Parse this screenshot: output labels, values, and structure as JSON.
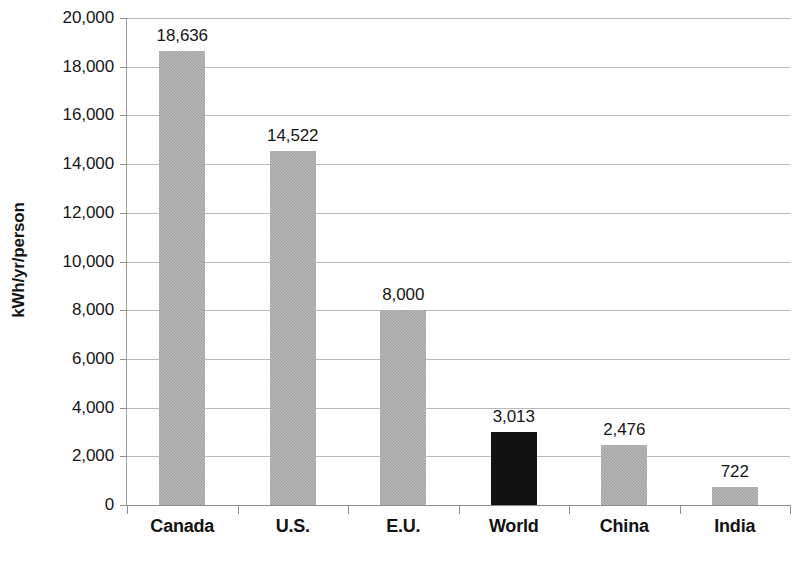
{
  "chart_data": {
    "type": "bar",
    "title": "",
    "xlabel": "",
    "ylabel": "kWh/yr/person",
    "categories": [
      "Canada",
      "U.S.",
      "E.U.",
      "World",
      "China",
      "India"
    ],
    "values": [
      18636,
      14522,
      8000,
      3013,
      2476,
      722
    ],
    "value_labels": [
      "18,636",
      "14,522",
      "8,000",
      "3,013",
      "2,476",
      "722"
    ],
    "ylim": [
      0,
      20000
    ],
    "ytick_step": 2000,
    "ytick_labels": [
      "20,000",
      "18,000",
      "16,000",
      "14,000",
      "12,000",
      "10,000",
      "8,000",
      "6,000",
      "4,000",
      "2,000",
      "0"
    ],
    "ytick_values": [
      20000,
      18000,
      16000,
      14000,
      12000,
      10000,
      8000,
      6000,
      4000,
      2000,
      0
    ],
    "grid": true,
    "legend": "none",
    "bar_colors": [
      "#a3a3a3",
      "#a3a3a3",
      "#a3a3a3",
      "#121212",
      "#a3a3a3",
      "#a3a3a3"
    ],
    "highlight_category": "World",
    "colors": {
      "bar_default": "#a3a3a3",
      "bar_highlight": "#121212",
      "gridline": "#b9b9b9",
      "axis": "#8f8f8f",
      "text": "#161616",
      "background": "#ffffff"
    }
  }
}
